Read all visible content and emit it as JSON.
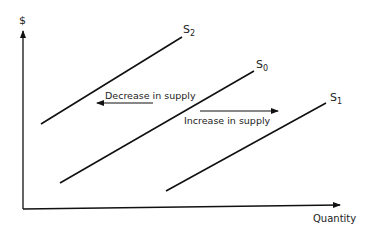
{
  "diagram": {
    "axes": {
      "y_label": "$",
      "x_label": "Quantity"
    },
    "curves": [
      {
        "id": "S2",
        "label_main": "S",
        "label_sub": "2",
        "role": "decreased supply"
      },
      {
        "id": "S0",
        "label_main": "S",
        "label_sub": "0",
        "role": "original supply"
      },
      {
        "id": "S1",
        "label_main": "S",
        "label_sub": "1",
        "role": "increased supply"
      }
    ],
    "annotations": {
      "decrease": "Decrease in supply",
      "increase": "Increase in supply"
    },
    "colors": {
      "line": "#111111",
      "text": "#222222",
      "background": "#ffffff"
    }
  }
}
